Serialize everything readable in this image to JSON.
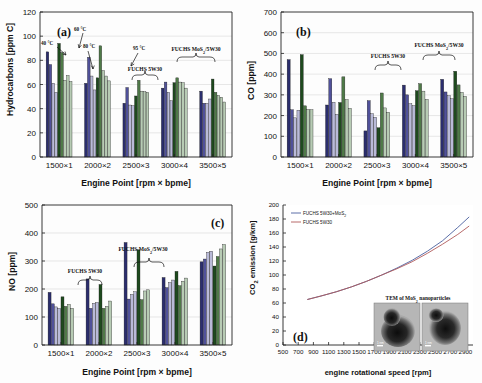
{
  "figure": {
    "panels": [
      "(a)",
      "(b)",
      "(c)",
      "(d)"
    ]
  },
  "colors": {
    "series1": "#2b2e6e",
    "series2": "#50519a",
    "series3": "#b9bad8",
    "series4": "#1e4a1e",
    "series5": "#4f7a48",
    "series6": "#b7cbb4",
    "line_mos2": "#4a5f9e",
    "line_base": "#b05a5a",
    "axis": "#222222",
    "grid": "#d9d9d9"
  },
  "common": {
    "xlabel": "Engine Point [rpm × bpme]",
    "categories": [
      "1500×1",
      "2000×2",
      "2500×3",
      "3000×4",
      "3500×5"
    ],
    "label_5w30": "FUCHS 5W30",
    "label_mos2": "FUCHS MoS2/5W30",
    "temp_annotations": [
      "40 °C",
      "60 °C",
      "80 °C",
      "95 °C"
    ]
  },
  "chart_data": [
    {
      "id": "a",
      "type": "bar",
      "panel_label": "(a)",
      "title": "",
      "xlabel": "Engine Point [rpm × bpme]",
      "ylabel": "Hydrocarbons [ppm C]",
      "ylim": [
        0,
        120
      ],
      "yticks": [
        0,
        20,
        40,
        60,
        80,
        100,
        120
      ],
      "grid": true,
      "legend": "brackets",
      "categories": [
        "1500×1",
        "2000×2",
        "2500×3",
        "3000×4",
        "3500×5"
      ],
      "series": [
        {
          "name": "FUCHS 5W30 40 °C",
          "values": [
            87,
            61,
            44.5,
            57,
            54.5
          ]
        },
        {
          "name": "FUCHS 5W30 60 °C",
          "values": [
            76.5,
            82.5,
            57.5,
            62,
            44.5
          ]
        },
        {
          "name": "FUCHS 5W30 80 °C",
          "values": [
            61,
            67,
            43,
            53.5,
            44.5
          ]
        },
        {
          "name": "FUCHS 5W30 95 °C",
          "values": [
            53.5,
            55.5,
            42.5,
            46.5,
            48
          ]
        },
        {
          "name": "FUCHS MoS2/5W30 40 °C",
          "values": [
            94,
            65.5,
            50.5,
            61.5,
            64.5
          ]
        },
        {
          "name": "FUCHS MoS2/5W30 60 °C",
          "values": [
            86.5,
            92,
            63.5,
            65.5,
            53.5
          ]
        },
        {
          "name": "FUCHS MoS2/5W30 80 °C",
          "values": [
            63.5,
            71.5,
            54.5,
            62,
            51
          ]
        },
        {
          "name": "FUCHS MoS2/5W30 95 °C",
          "values": [
            67.5,
            67,
            54,
            61.5,
            49.5
          ]
        },
        {
          "name": "FUCHS MoS2/5W30 extra",
          "values": [
            62.5,
            63,
            53.5,
            57,
            45.5
          ]
        }
      ],
      "annotations": [
        "40 °C",
        "60 °C",
        "80 °C",
        "95 °C",
        "FUCHS 5W30",
        "FUCHS MoS2/5W30"
      ]
    },
    {
      "id": "b",
      "type": "bar",
      "panel_label": "(b)",
      "title": "",
      "xlabel": "Engine Point [rpm × bpme]",
      "ylabel": "CO [ppm]",
      "ylim": [
        0,
        700
      ],
      "yticks": [
        0,
        100,
        200,
        300,
        400,
        500,
        600,
        700
      ],
      "grid": true,
      "legend": "brackets",
      "categories": [
        "1500×1",
        "2000×2",
        "2500×3",
        "3000×4",
        "3500×5"
      ],
      "series": [
        {
          "name": "FUCHS 5W30 40 °C",
          "values": [
            470,
            251,
            126,
            347,
            375
          ]
        },
        {
          "name": "FUCHS 5W30 60 °C",
          "values": [
            228,
            378,
            272,
            300,
            314
          ]
        },
        {
          "name": "FUCHS 5W30 80 °C",
          "values": [
            189,
            264,
            209,
            257,
            296
          ]
        },
        {
          "name": "FUCHS 5W30 95 °C",
          "values": [
            226,
            206,
            192,
            248,
            281
          ]
        },
        {
          "name": "FUCHS MoS2/5W30 40 °C",
          "values": [
            494,
            263,
            141,
            320,
            414
          ]
        },
        {
          "name": "FUCHS MoS2/5W30 60 °C",
          "values": [
            247,
            387,
            309,
            354,
            348
          ]
        },
        {
          "name": "FUCHS MoS2/5W30 80 °C",
          "values": [
            230,
            277,
            237,
            318,
            312
          ]
        },
        {
          "name": "FUCHS MoS2/5W30 95 °C",
          "values": [
            228,
            235,
            216,
            278,
            293
          ]
        }
      ],
      "annotations": [
        "FUCHS 5W30",
        "FUCHS MoS2/5W30"
      ]
    },
    {
      "id": "c",
      "type": "bar",
      "panel_label": "(c)",
      "title": "",
      "xlabel": "Engine Point [rpm × bpme]",
      "ylabel": "NO [ppm]",
      "ylim": [
        0,
        500
      ],
      "yticks": [
        0,
        100,
        200,
        300,
        400,
        500
      ],
      "grid": true,
      "legend": "brackets",
      "categories": [
        "1500×1",
        "2000×2",
        "2500×3",
        "3000×4",
        "3500×5"
      ],
      "series": [
        {
          "name": "FUCHS 5W30 40 °C",
          "values": [
            188,
            236,
            366,
            241,
            297
          ]
        },
        {
          "name": "FUCHS 5W30 60 °C",
          "values": [
            147,
            131,
            164,
            205,
            307
          ]
        },
        {
          "name": "FUCHS 5W30 80 °C",
          "values": [
            136,
            149,
            181,
            223,
            331
          ]
        },
        {
          "name": "FUCHS 5W30 95 °C",
          "values": [
            131,
            152,
            190,
            232,
            335
          ]
        },
        {
          "name": "FUCHS MoS2/5W30 40 °C",
          "values": [
            172,
            216,
            340,
            263,
            282
          ]
        },
        {
          "name": "FUCHS MoS2/5W30 60 °C",
          "values": [
            138,
            131,
            162,
            212,
            316
          ]
        },
        {
          "name": "FUCHS MoS2/5W30 80 °C",
          "values": [
            145,
            138,
            193,
            228,
            343
          ]
        },
        {
          "name": "FUCHS MoS2/5W30 95 °C",
          "values": [
            131,
            157,
            197,
            239,
            359
          ]
        }
      ],
      "annotations": [
        "FUCHS 5W30",
        "FUCHS MoS2/5W30"
      ]
    },
    {
      "id": "d",
      "type": "line",
      "panel_label": "(d)",
      "title": "",
      "xlabel": "engine rotational speed [rpm]",
      "ylabel": "CO2 emission [g/km]",
      "xlim": [
        500,
        3000
      ],
      "ylim": [
        0,
        200
      ],
      "xticks": [
        500,
        700,
        900,
        1100,
        1300,
        1500,
        1700,
        1900,
        2100,
        2300,
        2500,
        2700,
        2900
      ],
      "yticks": [
        0,
        20,
        40,
        60,
        80,
        100,
        120,
        140,
        160,
        180,
        200
      ],
      "grid": false,
      "legend_position": "top-left",
      "legend": [
        "FUCHS 5W30+MoS2",
        "FUCHS 5W30"
      ],
      "x": [
        820,
        1000,
        1200,
        1400,
        1600,
        1800,
        2000,
        2200,
        2400,
        2600,
        2800,
        2950
      ],
      "series": [
        {
          "name": "FUCHS 5W30+MoS2",
          "values": [
            65,
            70,
            76,
            83,
            91,
            100,
            110,
            121,
            134,
            149,
            168,
            183
          ]
        },
        {
          "name": "FUCHS 5W30",
          "values": [
            65,
            70,
            76,
            83,
            91,
            100,
            109,
            119,
            131,
            144,
            158,
            170
          ]
        }
      ],
      "inset": {
        "caption": "TEM of MoS2 nanoparticles",
        "scale_labels": [
          "1 nm",
          "1 nm"
        ],
        "image_count": 2
      }
    }
  ]
}
